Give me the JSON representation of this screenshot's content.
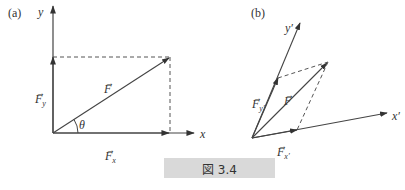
{
  "figure": {
    "caption": "図 3.4",
    "colors": {
      "line": "#333333",
      "caption_bg": "#d9d9d9"
    }
  },
  "panel_a": {
    "label": "(a)",
    "axes": {
      "x_label": "x",
      "y_label": "y"
    },
    "vector_label": "F",
    "component_x": {
      "base": "F",
      "sub": "x"
    },
    "component_y": {
      "base": "F",
      "sub": "y"
    },
    "angle_label": "θ",
    "vector_bar": "→"
  },
  "panel_b": {
    "label": "(b)",
    "axes": {
      "x_label": "x′",
      "y_label": "y′"
    },
    "vector_label": "F",
    "component_x": {
      "base": "F",
      "sub": "x′"
    },
    "component_y": {
      "base": "F",
      "sub": "y′"
    },
    "vector_bar": "→"
  }
}
